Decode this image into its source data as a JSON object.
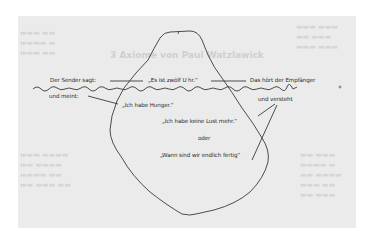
{
  "diagram": {
    "type": "iceberg-communication-model",
    "faded_background_heading": "3 Axiome von Paul Watzlawick",
    "above_waterline": {
      "sender_label": "Der Sender sagt:",
      "message": "„Es ist zwölf U hr.“",
      "receiver_label": "Das hört der Empfänger"
    },
    "below_waterline": {
      "sender_meaning_label": "und meint:",
      "meaning": "„Ich habe Hunger.“",
      "receiver_understanding_label": "und versteht",
      "interpretation_1": "„Ich habe keine Lust mehr.“",
      "separator": "oder",
      "interpretation_2": "„Wann sind wir endlich fertig“"
    },
    "colors": {
      "page_background": "#ebebeb",
      "outer_background": "#ffffff",
      "line": "#3a3a3a",
      "text": "#2a2a2a",
      "ghost_text": "#d6d6d6"
    }
  }
}
